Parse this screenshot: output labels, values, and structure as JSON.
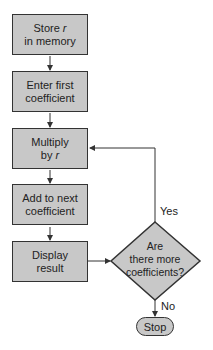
{
  "diagram": {
    "type": "flowchart",
    "colors": {
      "fill": "#c8c8c8",
      "stroke": "#333333",
      "background": "#ffffff"
    },
    "nodes": [
      {
        "id": "store",
        "shape": "rectangle",
        "line1": "Store ",
        "line1_italic": "r",
        "line2": "in memory"
      },
      {
        "id": "enter",
        "shape": "rectangle",
        "line1": "Enter first",
        "line2": "coefficient"
      },
      {
        "id": "multiply",
        "shape": "rectangle",
        "line1": "Multiply",
        "line2": "by ",
        "line2_italic": "r"
      },
      {
        "id": "add",
        "shape": "rectangle",
        "line1": "Add to next",
        "line2": "coefficient"
      },
      {
        "id": "display",
        "shape": "rectangle",
        "line1": "Display",
        "line2": "result"
      },
      {
        "id": "decision",
        "shape": "diamond",
        "line1": "Are",
        "line2": "there more",
        "line3": "coefficients?"
      },
      {
        "id": "stop",
        "shape": "terminal",
        "label": "Stop"
      }
    ],
    "edges": [
      {
        "from": "store",
        "to": "enter"
      },
      {
        "from": "enter",
        "to": "multiply"
      },
      {
        "from": "multiply",
        "to": "add"
      },
      {
        "from": "add",
        "to": "display"
      },
      {
        "from": "display",
        "to": "decision"
      },
      {
        "from": "decision",
        "to": "multiply",
        "label": "Yes"
      },
      {
        "from": "decision",
        "to": "stop",
        "label": "No"
      }
    ],
    "edge_labels": {
      "yes": "Yes",
      "no": "No"
    }
  }
}
